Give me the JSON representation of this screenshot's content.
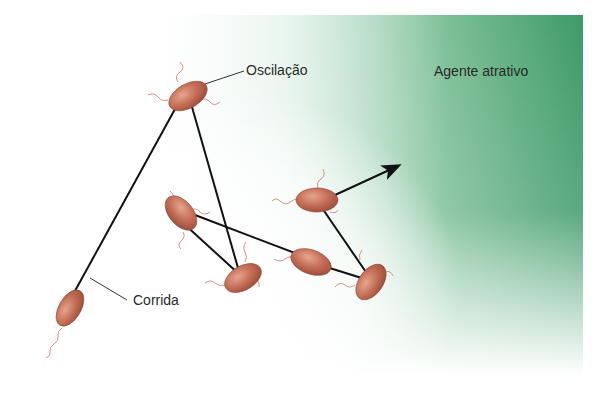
{
  "figure": {
    "colors": {
      "attractant_gradient_dark": "#3d9a68",
      "attractant_gradient_mid": "#8cc7a3",
      "background": "#ffffff",
      "cell_body": "#b8604a",
      "cell_highlight": "#e7a58f",
      "path_line": "#111111",
      "flagella": "#c98a80"
    },
    "labels": {
      "tumble": "Oscilação",
      "run": "Corrida",
      "attractant": "Agente atrativo"
    },
    "cells": [
      {
        "id": "cell-start",
        "role": "start"
      },
      {
        "id": "cell-tumble-1",
        "role": "tumble"
      },
      {
        "id": "cell-2",
        "role": "intermediate"
      },
      {
        "id": "cell-3",
        "role": "intermediate"
      },
      {
        "id": "cell-4",
        "role": "intermediate"
      },
      {
        "id": "cell-5",
        "role": "intermediate"
      },
      {
        "id": "cell-6",
        "role": "final"
      }
    ],
    "path_order": [
      "cell-start",
      "cell-tumble-1",
      "cell-3",
      "cell-2",
      "cell-4",
      "cell-5",
      "cell-6"
    ],
    "arrow": {
      "direction": "toward attractant"
    }
  }
}
